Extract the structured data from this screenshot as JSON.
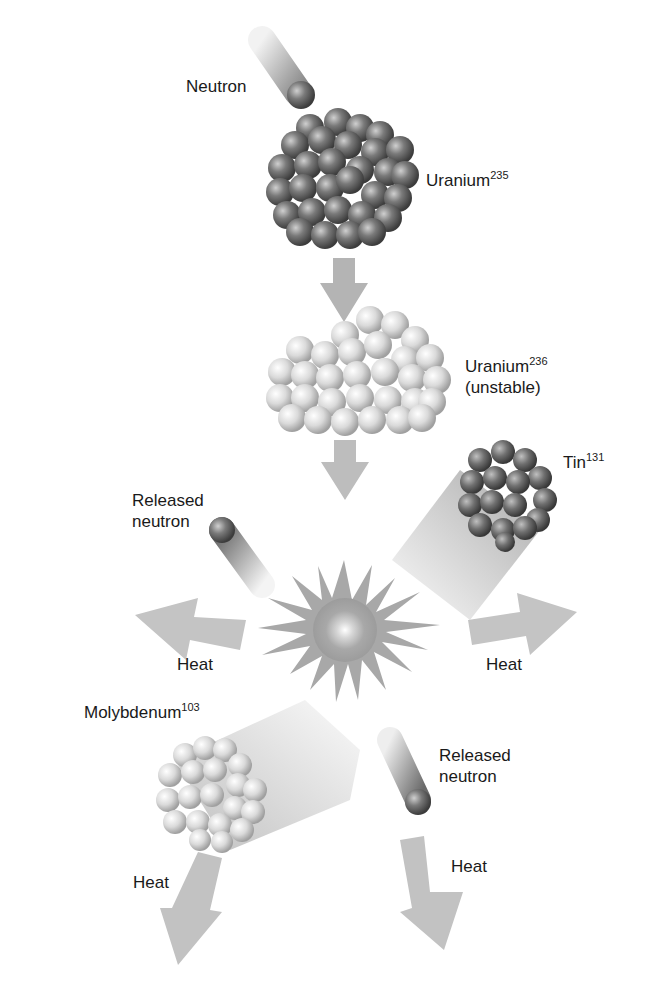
{
  "diagram": {
    "labels": {
      "neutron": "Neutron",
      "uranium235": {
        "name": "Uranium",
        "sup": "235"
      },
      "uranium236": {
        "name": "Uranium",
        "sup": "236",
        "note": "(unstable)"
      },
      "tin131": {
        "name": "Tin",
        "sup": "131"
      },
      "released_neutron_1": {
        "line1": "Released",
        "line2": "neutron"
      },
      "heat_left": "Heat",
      "heat_right": "Heat",
      "molybdenum103": {
        "name": "Molybdenum",
        "sup": "103"
      },
      "released_neutron_2": {
        "line1": "Released",
        "line2": "neutron"
      },
      "heat_bottom_left": "Heat",
      "heat_bottom_right": "Heat"
    },
    "colors": {
      "arrow": "#b8b8b8",
      "nucleus_dark": "#6e6e6e",
      "nucleus_mid": "#9a9a9a",
      "nucleus_light": "#c8c8c8",
      "burst": "#a6a6a6",
      "text": "#1a1a1a"
    }
  }
}
